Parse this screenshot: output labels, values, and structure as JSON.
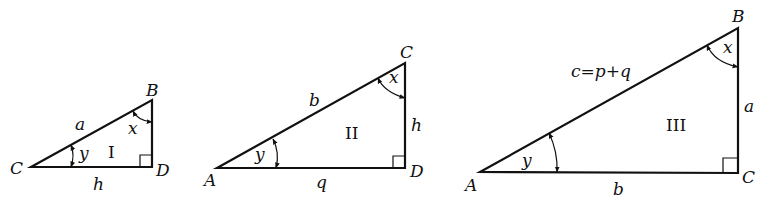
{
  "figure": {
    "triangles": [
      {
        "id": "I",
        "roman_label": "I",
        "vertices": {
          "left": "C",
          "top": "B",
          "right_angle": "D"
        },
        "sides": {
          "hypotenuse": "a",
          "base": "h"
        },
        "angles": {
          "top": "x",
          "left": "y"
        }
      },
      {
        "id": "II",
        "roman_label": "II",
        "vertices": {
          "left": "A",
          "top": "C",
          "right_angle": "D"
        },
        "sides": {
          "hypotenuse": "b",
          "base": "q",
          "vertical": "h"
        },
        "angles": {
          "top": "x",
          "left": "y"
        }
      },
      {
        "id": "III",
        "roman_label": "III",
        "vertices": {
          "left": "A",
          "top": "B",
          "right_angle": "C"
        },
        "sides": {
          "hypotenuse": "c=p+q",
          "base": "b",
          "vertical": "a"
        },
        "angles": {
          "top": "x",
          "left": "y"
        }
      }
    ]
  }
}
